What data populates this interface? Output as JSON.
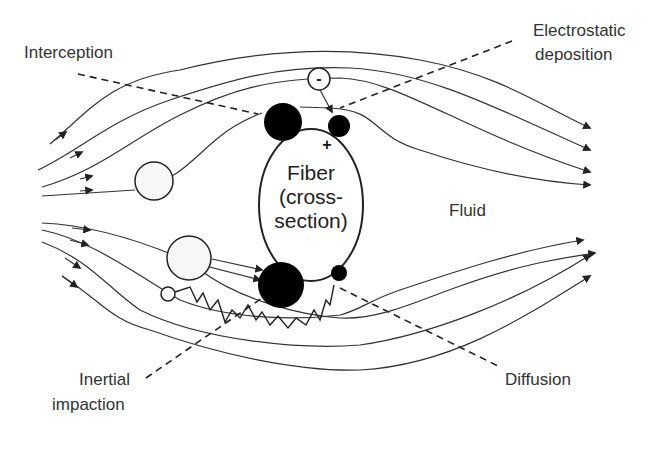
{
  "diagram": {
    "labels": {
      "interception": "Interception",
      "electrostatic_line1": "Electrostatic",
      "electrostatic_line2": "deposition",
      "fluid": "Fluid",
      "inertial_line1": "Inertial",
      "inertial_line2": "impaction",
      "diffusion": "Diffusion"
    },
    "fiber": {
      "line1": "Fiber",
      "line2": "(cross-",
      "line3": "section)"
    },
    "charges": {
      "particle_charge": "-",
      "fiber_charge": "+"
    },
    "colors": {
      "line": "#222222",
      "particle_fill_dark": "#000000",
      "particle_fill_light": "#f7f7f7",
      "text": "#333333"
    }
  }
}
